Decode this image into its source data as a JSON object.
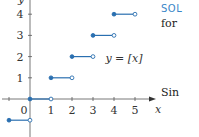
{
  "chart_data": {
    "type": "line",
    "title": "",
    "function_label": "y = [x]",
    "xlabel": "x",
    "ylabel": "y",
    "x_ticks": [
      "1",
      "2",
      "3",
      "4",
      "5"
    ],
    "y_ticks": [
      "1",
      "2",
      "3",
      "4"
    ],
    "origin_label": "0",
    "xlim": [
      -1.4,
      5.8
    ],
    "ylim": [
      -1.6,
      4.6
    ],
    "segments": [
      {
        "x_start": -1,
        "x_end": 0,
        "y": -1,
        "start_closed": true,
        "end_closed": false
      },
      {
        "x_start": 0,
        "x_end": 1,
        "y": 0,
        "start_closed": true,
        "end_closed": false
      },
      {
        "x_start": 1,
        "x_end": 2,
        "y": 1,
        "start_closed": true,
        "end_closed": false
      },
      {
        "x_start": 2,
        "x_end": 3,
        "y": 2,
        "start_closed": true,
        "end_closed": false
      },
      {
        "x_start": 3,
        "x_end": 4,
        "y": 3,
        "start_closed": true,
        "end_closed": false
      },
      {
        "x_start": 4,
        "x_end": 5,
        "y": 4,
        "start_closed": true,
        "end_closed": false
      }
    ],
    "series_color": "#2a6fb0",
    "grid": false
  },
  "side_text": {
    "heading": "SOL",
    "line1": "for",
    "line2": "Sin"
  }
}
